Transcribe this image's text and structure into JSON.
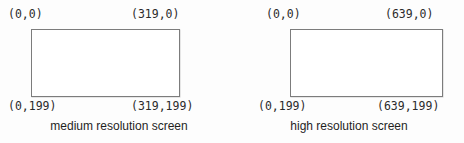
{
  "figure": {
    "background_color": "#ffffff",
    "line_color": "#7c7c7c",
    "text_color": "#2b2b2b"
  },
  "panels": [
    {
      "id": "medium",
      "caption": "medium resolution screen",
      "corners": {
        "top_left": "(0,0)",
        "top_right": "(319,0)",
        "bottom_left": "(0,199)",
        "bottom_right": "(319,199)"
      },
      "resolution": {
        "width_pixels": 320,
        "height_pixels": 200,
        "max_x": 319,
        "max_y": 199
      }
    },
    {
      "id": "high",
      "caption": "high resolution screen",
      "corners": {
        "top_left": "(0,0)",
        "top_right": "(639,0)",
        "bottom_left": "(0,199)",
        "bottom_right": "(639,199)"
      },
      "resolution": {
        "width_pixels": 640,
        "height_pixels": 200,
        "max_x": 639,
        "max_y": 199
      }
    }
  ]
}
